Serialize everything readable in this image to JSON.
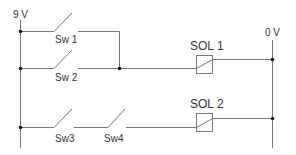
{
  "diagram": {
    "type": "electrical-ladder-circuit",
    "supply_label": "9 V",
    "ground_label": "0 V",
    "colors": {
      "wire": "#777777",
      "text": "#333333",
      "junction": "#111111",
      "background": "#ffffff"
    },
    "switches": [
      {
        "id": "sw1",
        "label": "Sw 1",
        "type": "normally-open"
      },
      {
        "id": "sw2",
        "label": "Sw 2",
        "type": "normally-open"
      },
      {
        "id": "sw3",
        "label": "Sw3",
        "type": "normally-open"
      },
      {
        "id": "sw4",
        "label": "Sw4",
        "type": "normally-open"
      }
    ],
    "solenoids": [
      {
        "id": "sol1",
        "label": "SOL 1"
      },
      {
        "id": "sol2",
        "label": "SOL 2"
      }
    ],
    "rungs": [
      {
        "name": "rung-1",
        "description": "Sw 1 OR Sw 2 energizes SOL 1",
        "elements": [
          "Sw 1 || Sw 2",
          "SOL 1"
        ]
      },
      {
        "name": "rung-2",
        "description": "Sw3 AND Sw4 energize SOL 2",
        "elements": [
          "Sw3",
          "Sw4",
          "SOL 2"
        ]
      }
    ]
  }
}
